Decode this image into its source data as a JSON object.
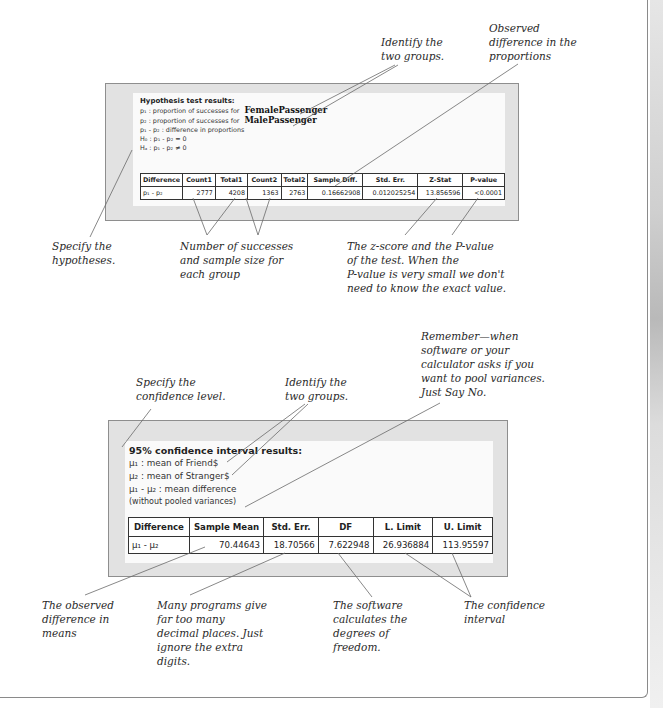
{
  "hypothesis_test": {
    "title": "Hypothesis test results:",
    "lines": {
      "p1": "p₁ : proportion of successes for",
      "p1_group": "FemalePassenger",
      "p2": "p₂ : proportion of successes for",
      "p2_group": "MalePassenger",
      "diff": "p₁ - p₂ : difference in proportions",
      "h0": "H₀ : p₁ - p₂ = 0",
      "ha": "Hₐ : p₁ - p₂ ≠ 0"
    },
    "table": {
      "headers": [
        "Difference",
        "Count1",
        "Total1",
        "Count2",
        "Total2",
        "Sample Diff.",
        "Std. Err.",
        "Z-Stat",
        "P-value"
      ],
      "row": [
        "p₁ - p₂",
        "2777",
        "4208",
        "1363",
        "2763",
        "0.16662908",
        "0.012025254",
        "13.856596",
        "<0.0001"
      ]
    }
  },
  "confidence_interval": {
    "title": "95% confidence interval results:",
    "lines": {
      "mu1": "μ₁ : mean of Friend$",
      "mu2": "μ₂ : mean of Stranger$",
      "diff": "μ₁ - μ₂ : mean difference",
      "pooled": "(without pooled variances)"
    },
    "table": {
      "headers": [
        "Difference",
        "Sample Mean",
        "Std. Err.",
        "DF",
        "L. Limit",
        "U. Limit"
      ],
      "row": [
        "μ₁ - μ₂",
        "70.44643",
        "18.70566",
        "7.622948",
        "26.936884",
        "113.95597"
      ]
    }
  },
  "annotations": {
    "identify_groups_top": "Identify the\ntwo groups.",
    "observed_diff_props": "Observed\ndifference in the\nproportions",
    "specify_hypotheses": "Specify the\nhypotheses.",
    "successes_sizes": "Number of successes\nand sample size for\neach group",
    "zscore_pvalue": "The z-score and the P-value\nof the test. When the\nP-value is very small we don't\nneed to know the exact value.",
    "specify_conf_level": "Specify the\nconfidence level.",
    "identify_groups_bottom": "Identify the\ntwo groups.",
    "pool_variances": "Remember—when\nsoftware or your\ncalculator asks if you\nwant to pool variances.\nJust Say No.",
    "observed_diff_means": "The observed\ndifference in\nmeans",
    "decimal_places": "Many programs give\nfar too many\ndecimal places. Just\nignore the extra\ndigits.",
    "degrees_freedom": "The software\ncalculates the\ndegrees of\nfreedom.",
    "conf_interval": "The confidence\ninterval"
  }
}
